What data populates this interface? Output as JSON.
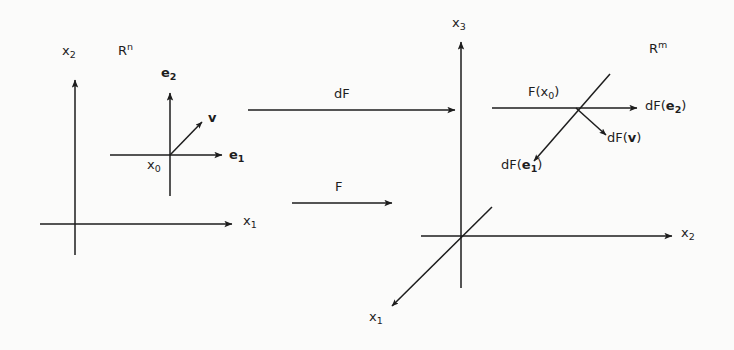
{
  "figure": {
    "type": "math-diagram",
    "stroke_color": "#1d1d1d",
    "background_color": "#fbfbfa"
  },
  "domain_space": {
    "space_label": "R",
    "space_exponent": "n",
    "axis_vertical_label": "x",
    "axis_vertical_sub": "2",
    "axis_horizontal_label": "x",
    "axis_horizontal_sub": "1",
    "basepoint_label": "x",
    "basepoint_sub": "0",
    "tangent_basis_1_label": "e",
    "tangent_basis_1_sub": "1",
    "tangent_basis_2_label": "e",
    "tangent_basis_2_sub": "2",
    "tangent_vector_label": "v"
  },
  "maps": {
    "differential_label": "dF",
    "function_label": "F"
  },
  "codomain_space": {
    "space_label": "R",
    "space_exponent": "m",
    "axis_vertical_label": "x",
    "axis_vertical_sub": "3",
    "axis_horizontal_label": "x",
    "axis_horizontal_sub": "2",
    "axis_diagonal_label": "x",
    "axis_diagonal_sub": "1",
    "image_point_label": "F(x",
    "image_point_sub": "0",
    "image_point_close": ")",
    "image_basis_1_prefix": "dF(",
    "image_basis_1_vec": "e",
    "image_basis_1_sub": "1",
    "image_basis_1_close": ")",
    "image_basis_2_prefix": "dF(",
    "image_basis_2_vec": "e",
    "image_basis_2_sub": "2",
    "image_basis_2_close": ")",
    "image_vector_prefix": "dF(",
    "image_vector_vec": "v",
    "image_vector_close": ")"
  }
}
